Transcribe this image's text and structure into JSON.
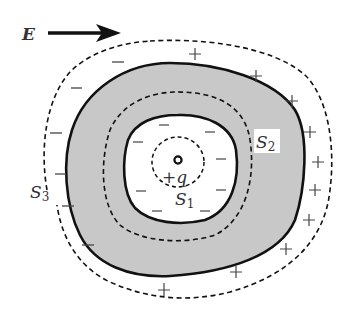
{
  "diagram": {
    "field_label": "E",
    "charge_label": "+q",
    "surfaces": {
      "s1": {
        "main": "S",
        "sub": "1"
      },
      "s2": {
        "main": "S",
        "sub": "2"
      },
      "s3": {
        "main": "S",
        "sub": "3"
      }
    },
    "signs": {
      "minus": "−",
      "plus": "+"
    },
    "colors": {
      "conductor_fill": "#c8c8c8",
      "stroke": "#111111",
      "label": "#333333"
    }
  }
}
